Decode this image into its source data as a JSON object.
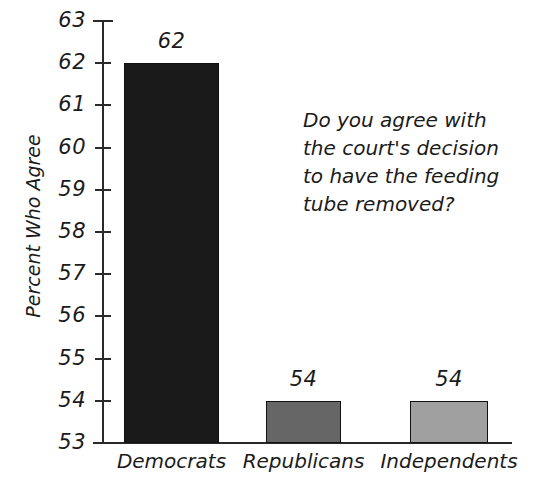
{
  "chart_data": {
    "type": "bar",
    "title": "",
    "xlabel": "",
    "ylabel": "Percent Who Agree",
    "categories": [
      "Democrats",
      "Republicans",
      "Independents"
    ],
    "values": [
      62,
      54,
      54
    ],
    "value_labels": [
      "62",
      "54",
      "54"
    ],
    "bar_colors": [
      "#1a1a1a",
      "#666666",
      "#a0a0a0"
    ],
    "bar_edge_color": "#111111",
    "ylim": [
      53,
      63
    ],
    "y_ticks": [
      63,
      62,
      61,
      60,
      59,
      58,
      57,
      56,
      55,
      54,
      53
    ],
    "y_tick_labels": [
      "63",
      "62",
      "61",
      "60",
      "59",
      "58",
      "57",
      "56",
      "55",
      "54",
      "53"
    ],
    "grid": false,
    "legend": "none",
    "annotations": [
      {
        "name": "survey-question",
        "lines": [
          "Do you agree with",
          "the court's decision",
          "to have the feeding",
          "tube removed?"
        ]
      }
    ],
    "axis_color": "#2a2a2a",
    "background_color": "#ffffff"
  }
}
